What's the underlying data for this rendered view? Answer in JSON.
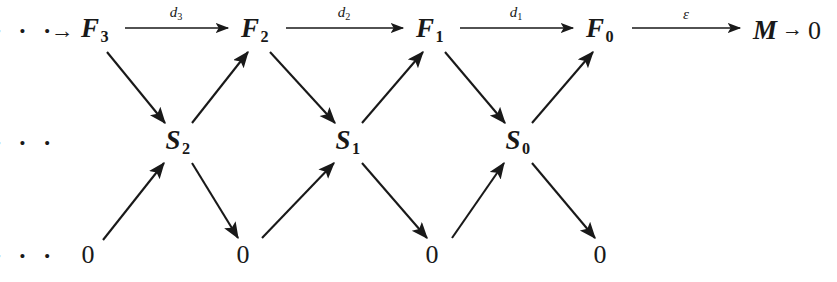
{
  "diagram": {
    "kind": "commutative-diagram",
    "ink_color": "#191919",
    "background_color": "#ffffff",
    "rows": {
      "top_y": 30,
      "middle_y": 142,
      "bottom_y": 255
    },
    "top_row": {
      "leading_ellipsis": "· · ·",
      "leading_ellipsis_x": 25,
      "leading_arrow": "→",
      "leading_arrow_x": 62,
      "objects": [
        {
          "label": "F",
          "subscript": "3",
          "x": 95
        },
        {
          "label": "F",
          "subscript": "2",
          "x": 255
        },
        {
          "label": "F",
          "subscript": "1",
          "x": 430
        },
        {
          "label": "F",
          "subscript": "0",
          "x": 600
        }
      ],
      "edges": [
        {
          "label": "d",
          "subscript": "3",
          "x1": 125,
          "x2": 228,
          "label_x": 176,
          "label_y": 14
        },
        {
          "label": "d",
          "subscript": "2",
          "x1": 286,
          "x2": 403,
          "label_x": 344,
          "label_y": 14
        },
        {
          "label": "d",
          "subscript": "1",
          "x1": 460,
          "x2": 573,
          "label_x": 516,
          "label_y": 14
        },
        {
          "label": "ε",
          "subscript": "",
          "x1": 632,
          "x2": 740,
          "label_x": 686,
          "label_y": 14
        }
      ],
      "terminal": {
        "symbol": "M",
        "arrow": "→",
        "zero": "0",
        "x": 787
      }
    },
    "middle_row": {
      "leading_ellipsis": "· · ·",
      "leading_ellipsis_x": 25,
      "objects": [
        {
          "label": "S",
          "subscript": "2",
          "x": 178
        },
        {
          "label": "S",
          "subscript": "1",
          "x": 348
        },
        {
          "label": "S",
          "subscript": "0",
          "x": 518
        }
      ]
    },
    "bottom_row": {
      "leading_ellipsis": "· · ·",
      "leading_ellipsis_x": 25,
      "zeros": [
        {
          "label": "0",
          "x": 88
        },
        {
          "label": "0",
          "x": 243
        },
        {
          "label": "0",
          "x": 432
        },
        {
          "label": "0",
          "x": 600
        }
      ]
    },
    "diagonal_edges": [
      {
        "name": "F3-to-S2",
        "from_x": 107,
        "from_y": 52,
        "to_x": 165,
        "to_y": 123,
        "direction": "down-right"
      },
      {
        "name": "S2-to-F2",
        "from_x": 192,
        "from_y": 123,
        "to_x": 248,
        "to_y": 52,
        "direction": "up-right"
      },
      {
        "name": "F2-to-S1",
        "from_x": 270,
        "from_y": 52,
        "to_x": 335,
        "to_y": 123,
        "direction": "down-right"
      },
      {
        "name": "S1-to-F1",
        "from_x": 362,
        "from_y": 123,
        "to_x": 423,
        "to_y": 52,
        "direction": "up-right"
      },
      {
        "name": "F1-to-S0",
        "from_x": 445,
        "from_y": 52,
        "to_x": 505,
        "to_y": 123,
        "direction": "down-right"
      },
      {
        "name": "S0-to-F0",
        "from_x": 532,
        "from_y": 123,
        "to_x": 593,
        "to_y": 52,
        "direction": "up-right"
      },
      {
        "name": "zero-to-S2",
        "from_x": 103,
        "from_y": 240,
        "to_x": 164,
        "to_y": 163,
        "direction": "up-right"
      },
      {
        "name": "S2-to-zero",
        "from_x": 192,
        "from_y": 163,
        "to_x": 238,
        "to_y": 238,
        "direction": "down-right"
      },
      {
        "name": "zero-to-S1",
        "from_x": 262,
        "from_y": 238,
        "to_x": 334,
        "to_y": 163,
        "direction": "up-right"
      },
      {
        "name": "S1-to-zero",
        "from_x": 362,
        "from_y": 163,
        "to_x": 427,
        "to_y": 238,
        "direction": "down-right"
      },
      {
        "name": "zero-to-S0",
        "from_x": 452,
        "from_y": 238,
        "to_x": 504,
        "to_y": 163,
        "direction": "up-right"
      },
      {
        "name": "S0-to-zero",
        "from_x": 532,
        "from_y": 163,
        "to_x": 595,
        "to_y": 238,
        "direction": "down-right"
      }
    ]
  }
}
